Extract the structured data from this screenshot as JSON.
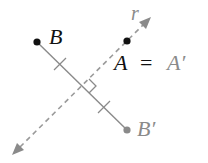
{
  "figure": {
    "colors": {
      "original": "#111111",
      "image": "#8a8a8a",
      "line": "#9a9a9a",
      "background": "#ffffff"
    },
    "points": {
      "B": {
        "label": "B",
        "x": 37,
        "y": 42
      },
      "B_prime": {
        "label": "B′",
        "x": 127,
        "y": 130
      },
      "A": {
        "label": "A",
        "x": 127,
        "y": 41
      }
    },
    "line_r": {
      "label": "r",
      "style": "dashed",
      "from": {
        "x": 15,
        "y": 153
      },
      "to": {
        "x": 150,
        "y": 18
      }
    },
    "equation": {
      "left": "A",
      "equals": "=",
      "right": "A′"
    },
    "midpoint": {
      "x": 82,
      "y": 86
    },
    "marks": {
      "right_angle": true,
      "congruence_ticks": 2
    }
  }
}
